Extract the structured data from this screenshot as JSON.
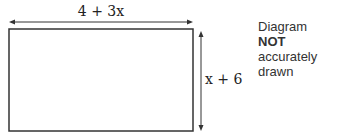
{
  "diagram": {
    "shape": "rectangle",
    "width_label": "4 + 3x",
    "height_label": "x + 6",
    "note_prefix": "Diagram ",
    "note_bold": "NOT",
    "note_suffix": "accurately drawn"
  }
}
